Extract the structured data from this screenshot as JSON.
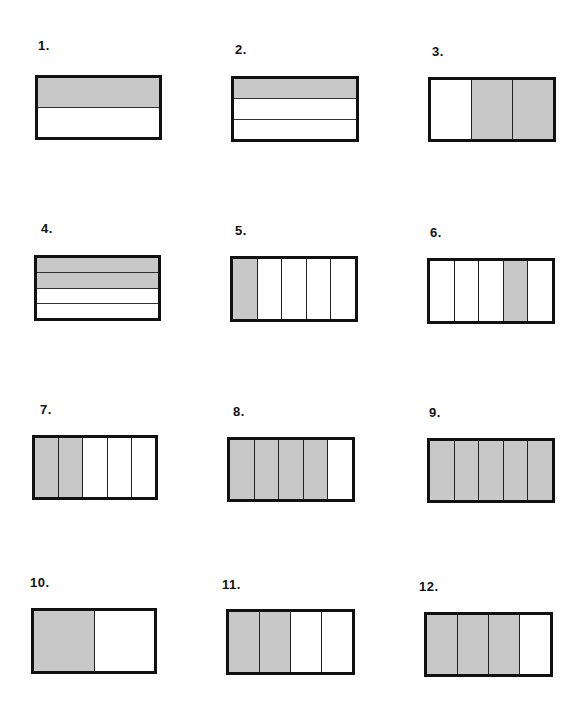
{
  "colors": {
    "shaded": "#c8c8c8",
    "unshaded": "#ffffff",
    "outline": "#111111"
  },
  "items": [
    {
      "number": "1.",
      "label_pos": [
        38,
        38
      ],
      "box": [
        35,
        75,
        127,
        65
      ],
      "orientation": "rows",
      "parts": 2,
      "shaded": [
        0
      ]
    },
    {
      "number": "2.",
      "label_pos": [
        235,
        42
      ],
      "box": [
        231,
        76,
        128,
        66
      ],
      "orientation": "rows",
      "parts": 3,
      "shaded": [
        0
      ]
    },
    {
      "number": "3.",
      "label_pos": [
        432,
        44
      ],
      "box": [
        428,
        77,
        128,
        65
      ],
      "orientation": "cols",
      "parts": 3,
      "shaded": [
        1,
        2
      ]
    },
    {
      "number": "4.",
      "label_pos": [
        41,
        221
      ],
      "box": [
        34,
        255,
        127,
        66
      ],
      "orientation": "rows",
      "parts": 4,
      "shaded": [
        0,
        1
      ]
    },
    {
      "number": "5.",
      "label_pos": [
        235,
        223
      ],
      "box": [
        230,
        256,
        128,
        66
      ],
      "orientation": "cols",
      "parts": 5,
      "shaded": [
        0
      ]
    },
    {
      "number": "6.",
      "label_pos": [
        430,
        225
      ],
      "box": [
        427,
        258,
        128,
        66
      ],
      "orientation": "cols",
      "parts": 5,
      "shaded": [
        3
      ]
    },
    {
      "number": "7.",
      "label_pos": [
        40,
        402
      ],
      "box": [
        32,
        435,
        126,
        65
      ],
      "orientation": "cols",
      "parts": 5,
      "shaded": [
        0,
        1
      ]
    },
    {
      "number": "8.",
      "label_pos": [
        233,
        404
      ],
      "box": [
        227,
        437,
        128,
        65
      ],
      "orientation": "cols",
      "parts": 5,
      "shaded": [
        0,
        1,
        2,
        3
      ]
    },
    {
      "number": "9.",
      "label_pos": [
        429,
        405
      ],
      "box": [
        427,
        438,
        128,
        65
      ],
      "orientation": "cols",
      "parts": 5,
      "shaded": [
        0,
        1,
        2,
        3,
        4
      ]
    },
    {
      "number": "10.",
      "label_pos": [
        30,
        575
      ],
      "box": [
        31,
        608,
        126,
        66
      ],
      "orientation": "cols",
      "parts": 2,
      "shaded": [
        0
      ]
    },
    {
      "number": "11.",
      "label_pos": [
        222,
        577
      ],
      "box": [
        226,
        609,
        129,
        66
      ],
      "orientation": "cols",
      "parts": 4,
      "shaded": [
        0,
        1
      ]
    },
    {
      "number": "12.",
      "label_pos": [
        419,
        579
      ],
      "box": [
        424,
        612,
        129,
        65
      ],
      "orientation": "cols",
      "parts": 4,
      "shaded": [
        0,
        1,
        2
      ]
    }
  ]
}
